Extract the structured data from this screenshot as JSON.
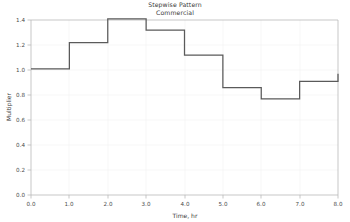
{
  "chart_data": {
    "type": "line",
    "subtype": "step-post",
    "title": "Stepwise Pattern",
    "subtitle": "Commercial",
    "xlabel": "Time, hr",
    "ylabel": "Multiplier",
    "xlim": [
      0.0,
      8.0
    ],
    "ylim": [
      0.0,
      1.4
    ],
    "grid": false,
    "legend": null,
    "line_color": "#5a5a5a",
    "background_color": "#ffffff",
    "axis_color": "#b9b9b9",
    "xticks": [
      0.0,
      1.0,
      2.0,
      3.0,
      4.0,
      5.0,
      6.0,
      7.0,
      8.0
    ],
    "xtick_labels": [
      "0.0",
      "1.0",
      "2.0",
      "3.0",
      "4.0",
      "5.0",
      "6.0",
      "7.0",
      "8.0"
    ],
    "yticks": [
      0.0,
      0.2,
      0.4,
      0.6,
      0.8,
      1.0,
      1.2,
      1.4
    ],
    "ytick_labels": [
      "0.0",
      "0.2",
      "0.4",
      "0.6",
      "0.8",
      "1.0",
      "1.2",
      "1.4"
    ],
    "x": [
      0.0,
      1.0,
      2.0,
      3.0,
      4.0,
      5.0,
      6.0,
      7.0,
      8.0
    ],
    "values": [
      1.01,
      1.22,
      1.41,
      1.32,
      1.12,
      0.86,
      0.77,
      0.91,
      0.97
    ],
    "step_intervals": [
      {
        "from": 0.0,
        "to": 1.0,
        "multiplier": 1.01
      },
      {
        "from": 1.0,
        "to": 2.0,
        "multiplier": 1.22
      },
      {
        "from": 2.0,
        "to": 3.0,
        "multiplier": 1.41
      },
      {
        "from": 3.0,
        "to": 4.0,
        "multiplier": 1.32
      },
      {
        "from": 4.0,
        "to": 5.0,
        "multiplier": 1.12
      },
      {
        "from": 5.0,
        "to": 6.0,
        "multiplier": 0.86
      },
      {
        "from": 6.0,
        "to": 7.0,
        "multiplier": 0.77
      },
      {
        "from": 7.0,
        "to": 8.0,
        "multiplier": 0.91
      }
    ],
    "endpoint_value": 0.97
  }
}
